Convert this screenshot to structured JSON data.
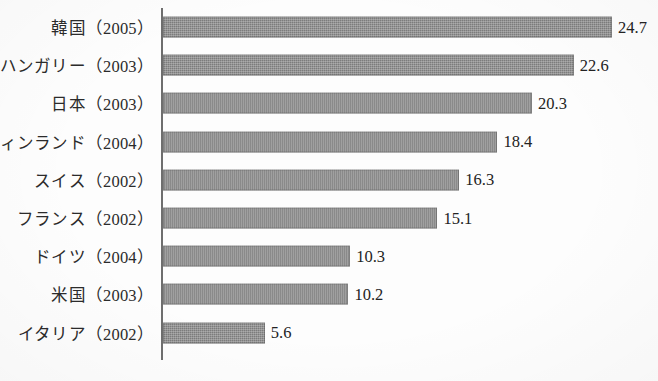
{
  "chart_data": {
    "type": "bar",
    "orientation": "horizontal",
    "title": "",
    "subtitle": "",
    "xlabel": "",
    "ylabel": "",
    "grid": false,
    "legend": false,
    "legend_position": "none",
    "axis_line": "left-vertical-only",
    "xlim": [
      0,
      24.7
    ],
    "value_label_format": "one-decimal",
    "bar_color": "#7c7c7c",
    "axis_color": "#6e6e6e",
    "text_color": "#2b2b2b",
    "categories": [
      "韓国（2005）",
      "ハンガリー（2003）",
      "日本（2003）",
      "フィンランド（2004）",
      "スイス（2002）",
      "フランス（2002）",
      "ドイツ（2004）",
      "米国（2003）",
      "イタリア（2002）"
    ],
    "values": [
      24.7,
      22.6,
      20.3,
      18.4,
      16.3,
      15.1,
      10.3,
      10.2,
      5.6
    ],
    "value_labels": [
      "24.7",
      "22.6",
      "20.3",
      "18.4",
      "16.3",
      "15.1",
      "10.3",
      "10.2",
      "5.6"
    ],
    "bars": [
      {
        "category": "韓国（2005）",
        "country": "韓国",
        "year": "2005",
        "value": 24.7,
        "label": "24.7"
      },
      {
        "category": "ハンガリー（2003）",
        "country": "ハンガリー",
        "year": "2003",
        "value": 22.6,
        "label": "22.6"
      },
      {
        "category": "日本（2003）",
        "country": "日本",
        "year": "2003",
        "value": 20.3,
        "label": "20.3"
      },
      {
        "category": "フィンランド（2004）",
        "country": "フィンランド",
        "year": "2004",
        "value": 18.4,
        "label": "18.4"
      },
      {
        "category": "スイス（2002）",
        "country": "スイス",
        "year": "2002",
        "value": 16.3,
        "label": "16.3"
      },
      {
        "category": "フランス（2002）",
        "country": "フランス",
        "year": "2002",
        "value": 15.1,
        "label": "15.1"
      },
      {
        "category": "ドイツ（2004）",
        "country": "ドイツ",
        "year": "2004",
        "value": 10.3,
        "label": "10.3"
      },
      {
        "category": "米国（2003）",
        "country": "米国",
        "year": "2003",
        "value": 10.2,
        "label": "10.2"
      },
      {
        "category": "イタリア（2002）",
        "country": "イタリア",
        "year": "2002",
        "value": 5.6,
        "label": "5.6"
      }
    ]
  }
}
